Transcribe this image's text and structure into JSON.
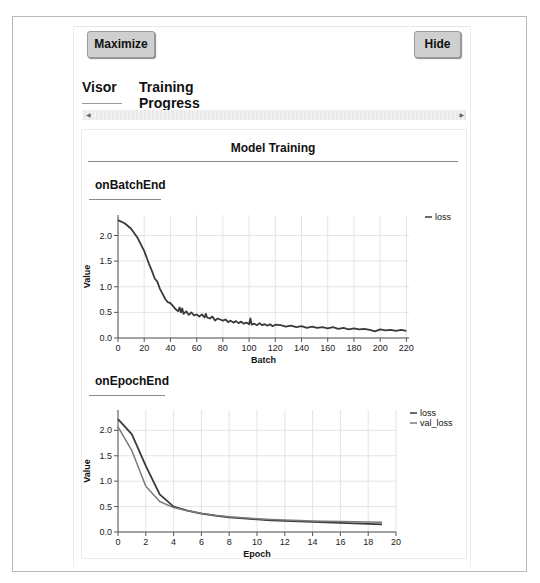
{
  "toolbar": {
    "maximize_label": "Maximize",
    "hide_label": "Hide"
  },
  "tabs": [
    {
      "label": "Visor"
    },
    {
      "label": "Training Progress"
    }
  ],
  "scrollbar": {
    "left_arrow": "◀",
    "right_arrow": "▶"
  },
  "panel": {
    "title": "Model Training",
    "sections": [
      {
        "title": "onBatchEnd"
      },
      {
        "title": "onEpochEnd"
      }
    ]
  },
  "colors": {
    "loss": "#3a3a3a",
    "val_loss": "#7a7a7a",
    "grid": "#e4e4e4",
    "axis": "#555555"
  },
  "chart_data": [
    {
      "type": "line",
      "title": "onBatchEnd",
      "xlabel": "Batch",
      "ylabel": "Value",
      "xlim": [
        0,
        222
      ],
      "ylim": [
        0,
        2.4
      ],
      "xticks": [
        0,
        20,
        40,
        60,
        80,
        100,
        120,
        140,
        160,
        180,
        200,
        220
      ],
      "yticks": [
        0.0,
        0.5,
        1.0,
        1.5,
        2.0
      ],
      "grid": true,
      "legend_position": "right",
      "series": [
        {
          "name": "loss",
          "x": [
            0,
            5,
            10,
            15,
            18,
            20,
            22,
            24,
            26,
            28,
            30,
            32,
            34,
            36,
            38,
            40,
            42,
            44,
            46,
            47,
            48,
            49,
            50,
            52,
            54,
            56,
            58,
            60,
            62,
            64,
            66,
            67,
            68,
            70,
            72,
            74,
            76,
            78,
            80,
            82,
            84,
            86,
            88,
            90,
            92,
            94,
            96,
            98,
            100,
            101,
            102,
            104,
            106,
            108,
            110,
            112,
            114,
            116,
            118,
            120,
            124,
            128,
            132,
            136,
            140,
            144,
            148,
            152,
            156,
            160,
            164,
            168,
            172,
            176,
            180,
            184,
            188,
            192,
            196,
            200,
            204,
            208,
            212,
            216,
            220
          ],
          "y": [
            2.3,
            2.24,
            2.13,
            1.95,
            1.8,
            1.7,
            1.56,
            1.42,
            1.3,
            1.16,
            1.1,
            0.96,
            0.86,
            0.76,
            0.7,
            0.68,
            0.62,
            0.56,
            0.52,
            0.6,
            0.5,
            0.58,
            0.47,
            0.52,
            0.45,
            0.5,
            0.44,
            0.46,
            0.42,
            0.46,
            0.4,
            0.47,
            0.4,
            0.38,
            0.42,
            0.34,
            0.38,
            0.36,
            0.34,
            0.36,
            0.31,
            0.34,
            0.3,
            0.33,
            0.29,
            0.32,
            0.28,
            0.3,
            0.27,
            0.38,
            0.26,
            0.28,
            0.25,
            0.29,
            0.25,
            0.27,
            0.24,
            0.27,
            0.23,
            0.26,
            0.25,
            0.22,
            0.24,
            0.21,
            0.23,
            0.2,
            0.22,
            0.2,
            0.21,
            0.19,
            0.21,
            0.18,
            0.2,
            0.17,
            0.19,
            0.17,
            0.18,
            0.16,
            0.13,
            0.17,
            0.15,
            0.16,
            0.14,
            0.16,
            0.14
          ]
        }
      ]
    },
    {
      "type": "line",
      "title": "onEpochEnd",
      "xlabel": "Epoch",
      "ylabel": "Value",
      "xlim": [
        0,
        20
      ],
      "ylim": [
        0,
        2.4
      ],
      "xticks": [
        0,
        2,
        4,
        6,
        8,
        10,
        12,
        14,
        16,
        18,
        20
      ],
      "yticks": [
        0.0,
        0.5,
        1.0,
        1.5,
        2.0
      ],
      "grid": true,
      "legend_position": "right",
      "series": [
        {
          "name": "loss",
          "x": [
            0,
            1,
            2,
            3,
            4,
            5,
            6,
            7,
            8,
            9,
            10,
            11,
            12,
            13,
            14,
            15,
            16,
            17,
            18,
            19
          ],
          "y": [
            2.22,
            1.92,
            1.3,
            0.74,
            0.5,
            0.42,
            0.36,
            0.32,
            0.29,
            0.27,
            0.25,
            0.23,
            0.22,
            0.21,
            0.2,
            0.19,
            0.18,
            0.17,
            0.16,
            0.15
          ]
        },
        {
          "name": "val_loss",
          "x": [
            0,
            1,
            2,
            3,
            4,
            5,
            6,
            7,
            8,
            9,
            10,
            11,
            12,
            13,
            14,
            15,
            16,
            17,
            18,
            19
          ],
          "y": [
            2.07,
            1.6,
            0.9,
            0.6,
            0.48,
            0.42,
            0.37,
            0.33,
            0.3,
            0.28,
            0.26,
            0.245,
            0.235,
            0.225,
            0.215,
            0.21,
            0.205,
            0.2,
            0.195,
            0.19
          ]
        }
      ]
    }
  ]
}
